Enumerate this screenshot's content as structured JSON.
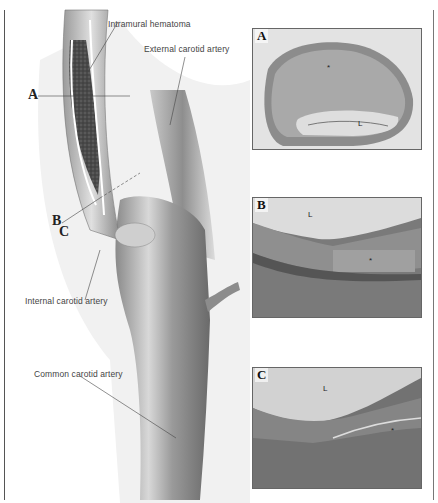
{
  "figure": {
    "illustration": {
      "labels": {
        "intramural_hematoma": "Intramural hematoma",
        "external_carotid": "External carotid artery",
        "internal_carotid": "Internal carotid artery",
        "common_carotid": "Common carotid artery"
      },
      "section_markers": {
        "a": "A",
        "b": "B",
        "c": "C"
      }
    },
    "panels": [
      {
        "letter": "A",
        "marks": [
          "*",
          "L"
        ]
      },
      {
        "letter": "B",
        "marks": [
          "L",
          "*"
        ]
      },
      {
        "letter": "C",
        "marks": [
          "L",
          "*"
        ]
      }
    ],
    "colors": {
      "line": "#555555",
      "tissue_dark": "#6a6a6a",
      "tissue_light": "#d6d6d6"
    }
  }
}
